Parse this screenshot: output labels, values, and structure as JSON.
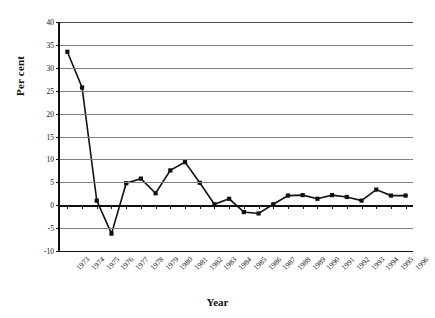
{
  "chart_data": {
    "type": "line",
    "title": "",
    "xlabel": "Year",
    "ylabel": "Per cent",
    "categories": [
      "1973",
      "1974",
      "1975",
      "1976",
      "1977",
      "1978",
      "1979",
      "1980",
      "1981",
      "1982",
      "1983",
      "1984",
      "1985",
      "1986",
      "1987",
      "1988",
      "1989",
      "1990",
      "1991",
      "1992",
      "1993",
      "1994",
      "1995",
      "1996"
    ],
    "values": [
      33.5,
      25.7,
      1.0,
      -6.2,
      4.8,
      5.8,
      2.6,
      7.6,
      9.4,
      4.9,
      0.2,
      1.4,
      -1.5,
      -1.8,
      0.2,
      2.1,
      2.2,
      1.4,
      2.2,
      1.8,
      1.0,
      3.4,
      2.1,
      2.1
    ],
    "ylim": [
      -10,
      40
    ],
    "ytick_step": 5,
    "ytick_labels": [
      "40",
      "35",
      "30",
      "25",
      "20",
      "15",
      "10",
      "5",
      "0",
      "-5",
      "-10"
    ],
    "grid": true,
    "grid_axis": "y",
    "legend": "none",
    "series_color": "#111111",
    "marker": "square"
  }
}
